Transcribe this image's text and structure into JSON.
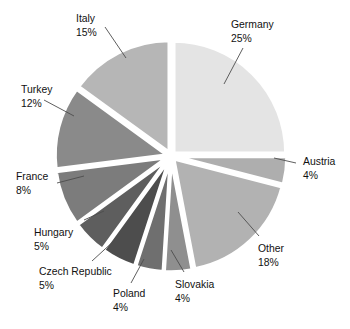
{
  "chart_data": {
    "type": "pie",
    "title": "",
    "subtitle": "",
    "xlabel": "",
    "ylabel": "",
    "legend_position": "none",
    "labels_position": "outside-with-leader-lines",
    "grid": false,
    "exploded": true,
    "total_percent": 100,
    "start_angle_deg": -90,
    "direction": "clockwise",
    "categories": [
      "Germany",
      "Austria",
      "Other",
      "Slovakia",
      "Poland",
      "Czech Republic",
      "Hungary",
      "France",
      "Turkey",
      "Italy"
    ],
    "values": [
      25,
      4,
      18,
      4,
      4,
      5,
      5,
      8,
      12,
      15
    ],
    "value_suffix": "%",
    "slices": [
      {
        "label": "Germany",
        "percent": 25,
        "percent_text": "25%",
        "color": "#e4e4e4"
      },
      {
        "label": "Austria",
        "percent": 4,
        "percent_text": "4%",
        "color": "#aeaeae"
      },
      {
        "label": "Other",
        "percent": 18,
        "percent_text": "18%",
        "color": "#b2b2b2"
      },
      {
        "label": "Slovakia",
        "percent": 4,
        "percent_text": "4%",
        "color": "#8f8f8f"
      },
      {
        "label": "Poland",
        "percent": 4,
        "percent_text": "4%",
        "color": "#6f6f6f"
      },
      {
        "label": "Czech Republic",
        "percent": 5,
        "percent_text": "5%",
        "color": "#4d4d4d"
      },
      {
        "label": "Hungary",
        "percent": 5,
        "percent_text": "5%",
        "color": "#5e5e5e"
      },
      {
        "label": "France",
        "percent": 8,
        "percent_text": "8%",
        "color": "#7c7c7c"
      },
      {
        "label": "Turkey",
        "percent": 12,
        "percent_text": "12%",
        "color": "#8a8a8a"
      },
      {
        "label": "Italy",
        "percent": 15,
        "percent_text": "15%",
        "color": "#b6b6b6"
      }
    ]
  },
  "labels": {
    "germany": {
      "name": "Germany",
      "pct": "25%"
    },
    "austria": {
      "name": "Austria",
      "pct": "4%"
    },
    "other": {
      "name": "Other",
      "pct": "18%"
    },
    "slovakia": {
      "name": "Slovakia",
      "pct": "4%"
    },
    "poland": {
      "name": "Poland",
      "pct": "4%"
    },
    "czech": {
      "name": "Czech Republic",
      "pct": "5%"
    },
    "hungary": {
      "name": "Hungary",
      "pct": "5%"
    },
    "france": {
      "name": "France",
      "pct": "8%"
    },
    "turkey": {
      "name": "Turkey",
      "pct": "12%"
    },
    "italy": {
      "name": "Italy",
      "pct": "15%"
    }
  },
  "colors": {
    "background": "#ffffff",
    "slice_border": "#ffffff",
    "leader_line": "#4d4d4d",
    "text": "#111111"
  }
}
